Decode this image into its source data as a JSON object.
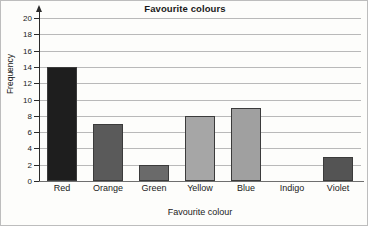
{
  "chart_data": {
    "type": "bar",
    "title": "Favourite colours",
    "xlabel": "Favourite colour",
    "ylabel": "Frequency",
    "categories": [
      "Red",
      "Orange",
      "Green",
      "Yellow",
      "Blue",
      "Indigo",
      "Violet"
    ],
    "values": [
      14,
      7,
      2,
      8,
      9,
      0,
      3
    ],
    "bar_colors": [
      "#1e1e1e",
      "#5a5a5a",
      "#6a6a6a",
      "#a6a6a6",
      "#a0a0a0",
      "#a0a0a0",
      "#545454"
    ],
    "ylim": [
      0,
      20
    ],
    "ytick_step": 2,
    "yticks": [
      20,
      18,
      16,
      14,
      12,
      10,
      8,
      6,
      4,
      2,
      0
    ],
    "ytick_labels": [
      "20",
      "18",
      "16",
      "14",
      "12",
      "10",
      "8",
      "6",
      "4",
      "2",
      "0"
    ],
    "grid": true,
    "legend": false,
    "bar_edge_color": "#3b3b3b",
    "axis_color": "#2b2b2b",
    "gridline_color": "#b9b9b9",
    "background": "#fdfdfb"
  }
}
